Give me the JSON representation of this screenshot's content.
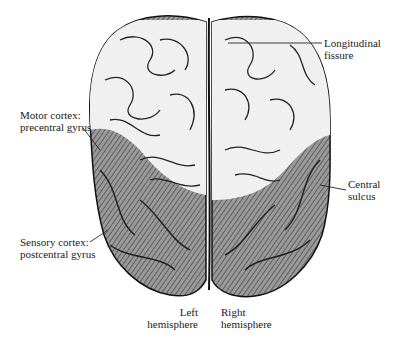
{
  "figure": {
    "labels": {
      "longitudinal_fissure": [
        "Longitudinal",
        "fissure"
      ],
      "motor_cortex": [
        "Motor cortex:",
        "precentral gyrus"
      ],
      "central_sulcus": [
        "Central",
        "sulcus"
      ],
      "sensory_cortex": [
        "Sensory cortex:",
        "postcentral gyrus"
      ],
      "left_hemisphere": [
        "Left",
        "hemisphere"
      ],
      "right_hemisphere": [
        "Right",
        "hemisphere"
      ]
    },
    "colors": {
      "frontal_fill": "#f2f2f2",
      "posterior_fill": "#8a8a8a",
      "outline": "#111111"
    }
  }
}
